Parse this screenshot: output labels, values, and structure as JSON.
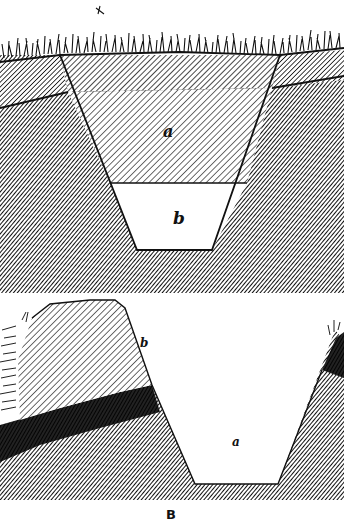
{
  "figure": {
    "top_caption_fragment": "",
    "panel_top": {
      "description": "Cross section of trench cut through sod and soil strata",
      "labels": {
        "a": "a",
        "b": "b"
      }
    },
    "panel_bottom": {
      "description": "Cross section of excavated trench beside a bank/mound",
      "labels": {
        "a": "a",
        "b": "b"
      },
      "caption": "B"
    },
    "colors": {
      "ink": "#111111",
      "paper": "#ffffff",
      "hatch_light": "#8a8a8a",
      "hatch_dark": "#2a2a2a"
    }
  }
}
